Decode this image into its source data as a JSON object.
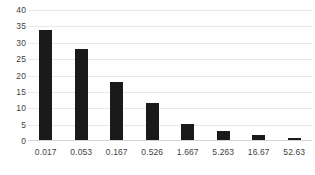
{
  "chart_data": {
    "type": "bar",
    "title": "",
    "subtitle": "",
    "xlabel": "",
    "ylabel": "",
    "categories": [
      "0.017",
      "0.053",
      "0.167",
      "0.526",
      "1.667",
      "5.263",
      "16.67",
      "52.63"
    ],
    "values": [
      34,
      28,
      18,
      11.5,
      5.2,
      3,
      1.7,
      0.8
    ],
    "series": [
      {
        "name": "",
        "values": [
          34,
          28,
          18,
          11.5,
          5.2,
          3,
          1.7,
          0.8
        ]
      }
    ],
    "ylim": [
      0,
      40
    ],
    "ytick_labels": [
      "0",
      "5",
      "10",
      "15",
      "20",
      "25",
      "30",
      "35",
      "40"
    ],
    "ytick_values": [
      0,
      5,
      10,
      15,
      20,
      25,
      30,
      35,
      40
    ],
    "grid": true,
    "legend": false,
    "legend_position": "none",
    "bar_color": "#1a1a1a",
    "gridline_color": "#e9e9e9",
    "axis_color": "#d5d5d5",
    "label_color": "#3f3f3f",
    "background_color": "#ffffff"
  }
}
